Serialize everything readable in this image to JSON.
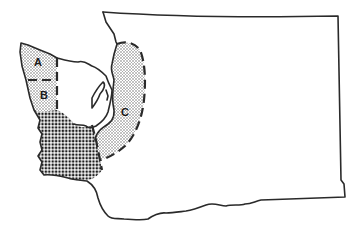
{
  "map": {
    "subject": "Washington State outline with shaded regions",
    "regions": [
      {
        "id": "A",
        "label": "A",
        "pattern": "light-stipple"
      },
      {
        "id": "B",
        "label": "B",
        "pattern": "light-stipple"
      },
      {
        "id": "C",
        "label": "C",
        "pattern": "light-stipple"
      },
      {
        "id": "southwest",
        "label": "",
        "pattern": "dense-dot"
      }
    ],
    "colors": {
      "outline": "#2a2a2a",
      "stipple_fill": "#d6d6d6",
      "dense_fill": "#9a9a9a",
      "background": "#ffffff"
    }
  }
}
